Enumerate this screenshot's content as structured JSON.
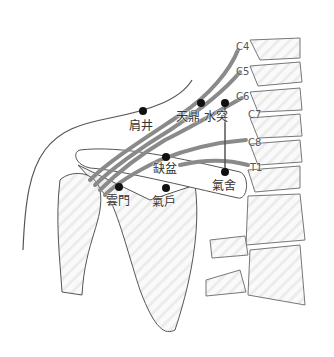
{
  "figure": {
    "colors": {
      "outline": "#555555",
      "bone_fill": "#f2f2f2",
      "nerve": "#8a8a8a",
      "dot": "#111111"
    }
  },
  "acupoints": [
    {
      "name": "肩井",
      "x": 143,
      "y": 111,
      "lx": 129,
      "ly": 120
    },
    {
      "name": "天鼎",
      "x": 201,
      "y": 103,
      "lx": 176,
      "ly": 111
    },
    {
      "name": "水突",
      "x": 225,
      "y": 103,
      "lx": 204,
      "ly": 111
    },
    {
      "name": "缺盆",
      "x": 166,
      "y": 157,
      "lx": 153,
      "ly": 163
    },
    {
      "name": "雲門",
      "x": 119,
      "y": 187,
      "lx": 106,
      "ly": 195
    },
    {
      "name": "氣戶",
      "x": 166,
      "y": 188,
      "lx": 152,
      "ly": 196
    },
    {
      "name": "氣舍",
      "x": 225,
      "y": 172,
      "lx": 212,
      "ly": 180
    }
  ],
  "nerve_roots": [
    {
      "name": "C4",
      "x": 236,
      "y": 42
    },
    {
      "name": "C5",
      "x": 236,
      "y": 67
    },
    {
      "name": "C6",
      "x": 236,
      "y": 92
    },
    {
      "name": "C7",
      "x": 248,
      "y": 110
    },
    {
      "name": "C8",
      "x": 248,
      "y": 138
    },
    {
      "name": "T1",
      "x": 250,
      "y": 163
    }
  ]
}
